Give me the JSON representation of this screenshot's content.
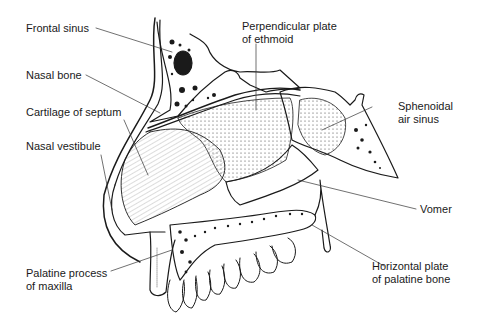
{
  "diagram": {
    "labels": {
      "frontal_sinus": "Frontal sinus",
      "nasal_bone": "Nasal bone",
      "cartilage_of_septum": "Cartilage of septum",
      "nasal_vestibule": "Nasal vestibule",
      "palatine_process_line1": "Palatine process",
      "palatine_process_line2": "of maxilla",
      "perpendicular_plate_line1": "Perpendicular plate",
      "perpendicular_plate_line2": "of ethmoid",
      "sphenoidal_line1": "Sphenoidal",
      "sphenoidal_line2": "air sinus",
      "vomer": "Vomer",
      "horizontal_plate_line1": "Horizontal plate",
      "horizontal_plate_line2": "of palatine bone"
    },
    "colors": {
      "ink": "#1a1a1a",
      "background": "#ffffff"
    }
  }
}
